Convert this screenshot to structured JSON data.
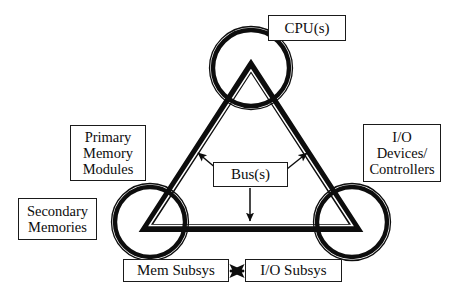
{
  "diagram": {
    "colors": {
      "stroke": "#0d0d0d",
      "background": "#ffffff"
    },
    "nodes": {
      "cpu": {
        "label": "CPU(s)"
      },
      "primary_memory": {
        "line1": "Primary",
        "line2": "Memory",
        "line3": "Modules"
      },
      "secondary_memory": {
        "line1": "Secondary",
        "line2": "Memories"
      },
      "io_devices": {
        "line1": "I/O",
        "line2": "Devices/",
        "line3": "Controllers"
      },
      "bus": {
        "label": "Bus(s)"
      },
      "mem_subsys": {
        "label": "Mem Subsys"
      },
      "io_subsys": {
        "label": "I/O Subsys"
      }
    },
    "shapes": {
      "circle_cpu": {
        "cx": 251,
        "cy": 68,
        "r": 39
      },
      "circle_memory": {
        "cx": 150,
        "cy": 222,
        "r": 36
      },
      "circle_io": {
        "cx": 352,
        "cy": 222,
        "r": 36
      },
      "triangle": {
        "apex": [
          251,
          70
        ],
        "left": [
          148,
          226
        ],
        "right": [
          354,
          226
        ]
      }
    },
    "arrows": {
      "bus_to_left_edge": {
        "from": [
          216,
          170
        ],
        "to": [
          196,
          151
        ]
      },
      "bus_to_right_edge": {
        "from": [
          288,
          170
        ],
        "to": [
          309,
          151
        ]
      },
      "bus_to_base": {
        "from": [
          250,
          188
        ],
        "to": [
          250,
          222
        ]
      },
      "mem_to_io_subsys": {
        "from": [
          229,
          270
        ],
        "to": [
          245,
          270
        ],
        "double_headed": true
      }
    }
  }
}
